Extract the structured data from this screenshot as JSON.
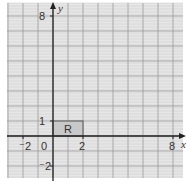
{
  "diagram": {
    "type": "coordinate-grid",
    "axes": {
      "x_label": "x",
      "y_label": "y",
      "x_range": [
        -3,
        8.5
      ],
      "y_range": [
        -3,
        8.5
      ],
      "origin_label": "0"
    },
    "tick_labels": {
      "x": [
        {
          "value": -2,
          "text": "⁻2"
        },
        {
          "value": 2,
          "text": "2"
        },
        {
          "value": 8,
          "text": "8"
        }
      ],
      "y": [
        {
          "value": 1,
          "text": "1"
        },
        {
          "value": 8,
          "text": "8"
        },
        {
          "value": -2,
          "text": "⁻2"
        }
      ]
    },
    "shapes": [
      {
        "name": "R",
        "label": "R",
        "x": 0,
        "y": 0,
        "width": 2,
        "height": 1,
        "fill": "#c8c8c8"
      }
    ],
    "colors": {
      "background": "#e6e6e6",
      "grid_major": "#9a9a9a",
      "grid_minor": "#d0d0d0",
      "axis": "#222222"
    }
  }
}
